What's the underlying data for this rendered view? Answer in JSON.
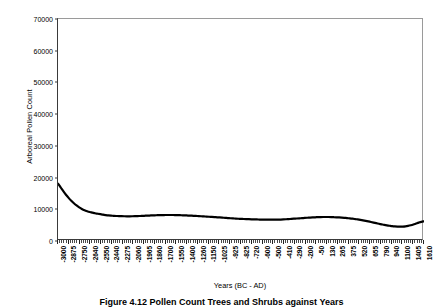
{
  "figure": {
    "caption": "Figure 4.12   Pollen Count Trees and Shrubs against Years"
  },
  "chart_data": {
    "type": "line",
    "title": "",
    "xlabel": "Years (BC - AD)",
    "ylabel": "Arboreal Pollen Count",
    "ylim": [
      0,
      70000
    ],
    "ytick_labels": [
      "0",
      "10000",
      "20000",
      "30000",
      "40000",
      "50000",
      "60000",
      "70000"
    ],
    "ytick_values": [
      0,
      10000,
      20000,
      30000,
      40000,
      50000,
      60000,
      70000
    ],
    "grid": false,
    "legend": false,
    "line_color": "#000000",
    "line_width": 2.2,
    "minor_ticks_between_labels": 4,
    "categories": [
      "-3000",
      "-2875",
      "-2750",
      "-2640",
      "-2550",
      "-2440",
      "-2275",
      "-2060",
      "-1965",
      "-1860",
      "-1700",
      "-1550",
      "-1400",
      "-1260",
      "-1150",
      "-1025",
      "-925",
      "-825",
      "-720",
      "-600",
      "-500",
      "-410",
      "-290",
      "-200",
      "-50",
      "130",
      "265",
      "375",
      "520",
      "655",
      "790",
      "940",
      "1100",
      "1405",
      "1610"
    ],
    "values": [
      18100,
      14200,
      11600,
      10000,
      9000,
      8350,
      7900,
      7750,
      7800,
      7900,
      8050,
      8150,
      8200,
      8150,
      8050,
      7900,
      7750,
      7550,
      7350,
      7150,
      6950,
      6800,
      6700,
      6750,
      6950,
      7200,
      7450,
      7550,
      7500,
      7250,
      6750,
      6000,
      5100,
      4550,
      6200
    ],
    "dense_x_values": [
      18100,
      16900,
      15700,
      14600,
      13600,
      12700,
      11900,
      11200,
      10600,
      10100,
      9700,
      9400,
      9150,
      8950,
      8750,
      8600,
      8450,
      8300,
      8180,
      8080,
      8000,
      7940,
      7890,
      7850,
      7820,
      7800,
      7790,
      7790,
      7800,
      7820,
      7850,
      7890,
      7930,
      7970,
      8010,
      8050,
      8090,
      8120,
      8150,
      8170,
      8190,
      8200,
      8205,
      8200,
      8190,
      8170,
      8140,
      8110,
      8070,
      8030,
      7990,
      7950,
      7900,
      7850,
      7800,
      7750,
      7700,
      7650,
      7600,
      7540,
      7480,
      7420,
      7360,
      7300,
      7240,
      7180,
      7120,
      7070,
      7020,
      6980,
      6940,
      6900,
      6870,
      6840,
      6810,
      6790,
      6770,
      6750,
      6730,
      6720,
      6710,
      6710,
      6720,
      6740,
      6770,
      6810,
      6860,
      6910,
      6970,
      7030,
      7090,
      7150,
      7210,
      7270,
      7330,
      7390,
      7440,
      7480,
      7520,
      7545,
      7560,
      7565,
      7560,
      7545,
      7520,
      7480,
      7430,
      7370,
      7300,
      7220,
      7130,
      7030,
      6920,
      6800,
      6660,
      6510,
      6350,
      6180,
      6000,
      5810,
      5620,
      5430,
      5250,
      5080,
      4930,
      4800,
      4690,
      4610,
      4560,
      4540,
      4560,
      4630,
      4760,
      4950,
      5200,
      5500,
      5800,
      6050,
      6200
    ]
  }
}
